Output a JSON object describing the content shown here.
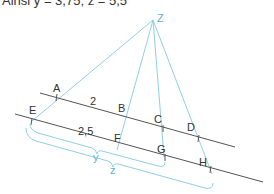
{
  "header": {
    "text": "Ainsi y = 3,75; z = 5,5"
  },
  "diagram": {
    "apex": "Z",
    "line1_points": [
      "A",
      "B",
      "C",
      "D"
    ],
    "line2_points": [
      "E",
      "F",
      "G",
      "H"
    ],
    "labels": {
      "Z": "Z",
      "A": "A",
      "B": "B",
      "C": "C",
      "D": "D",
      "E": "E",
      "F": "F",
      "G": "G",
      "H": "H",
      "AB": "2",
      "EF": "2,5",
      "y": "y",
      "z": "z"
    },
    "colors": {
      "ray": "#8fd0e6",
      "line": "#555555",
      "brace": "#8fd0e6",
      "label": "#333333",
      "var": "#5ab4d6"
    }
  }
}
